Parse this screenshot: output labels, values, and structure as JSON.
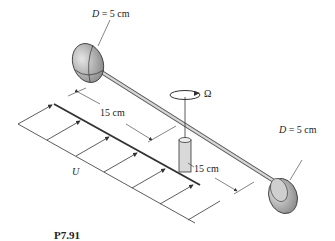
{
  "figure": {
    "id_label": "P7.91",
    "top_cup_label": "D = 5 cm",
    "top_cup_var": "D",
    "top_cup_value": " = 5 cm",
    "right_cup_var": "D",
    "right_cup_value": " = 5 cm",
    "dim_left": "15 cm",
    "dim_right": "15 cm",
    "rotation_label": "Ω",
    "flow_label": "U"
  },
  "colors": {
    "line": "#333333",
    "cup_fill": "#bdbdbd",
    "cup_dark": "#8a8a8a",
    "rod": "#cfcfcf"
  }
}
